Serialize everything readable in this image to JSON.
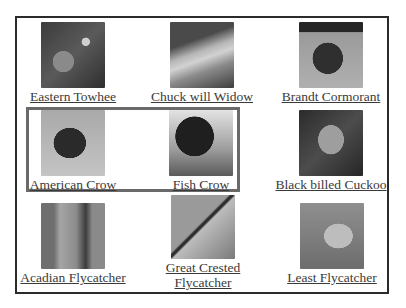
{
  "gallery": {
    "items": [
      {
        "label": "Eastern Towhee",
        "image": "eastern-towhee-thumbnail"
      },
      {
        "label": "Chuck will Widow",
        "image": "chuck-will-widow-thumbnail"
      },
      {
        "label": "Brandt Cormorant",
        "image": "brandt-cormorant-thumbnail"
      },
      {
        "label": "American Crow",
        "image": "american-crow-thumbnail",
        "highlighted": true
      },
      {
        "label": "Fish Crow",
        "image": "fish-crow-thumbnail",
        "highlighted": true
      },
      {
        "label": "Black billed Cuckoo",
        "image": "black-billed-cuckoo-thumbnail"
      },
      {
        "label": "Acadian Flycatcher",
        "image": "acadian-flycatcher-thumbnail"
      },
      {
        "label": "Great Crested Flycatcher",
        "image": "great-crested-flycatcher-thumbnail"
      },
      {
        "label": "Least Flycatcher",
        "image": "least-flycatcher-thumbnail"
      }
    ]
  },
  "colors": {
    "frame_border": "#2b2b2b",
    "highlight_border": "#6a6a6a",
    "link_text": "#3a3a3a"
  }
}
